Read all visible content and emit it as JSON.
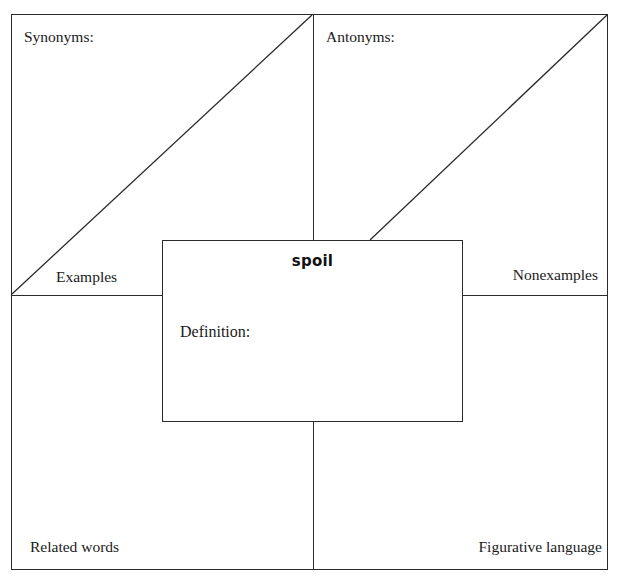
{
  "page": {
    "top_partial_text": "• •",
    "background_color": "#ffffff",
    "line_color": "#2b2b2b"
  },
  "organizer": {
    "type": "frayer-model-vocabulary-organizer",
    "center": {
      "word": "spoil",
      "definition_label": "Definition:"
    },
    "quadrants": [
      {
        "position": "top-left",
        "heading": "Synonyms:",
        "corner_label": "Examples",
        "has_diagonal": true
      },
      {
        "position": "top-right",
        "heading": "Antonyms:",
        "corner_label": "Nonexamples",
        "has_diagonal": true
      },
      {
        "position": "bottom-left",
        "heading": "",
        "corner_label": "Related words",
        "has_diagonal": false
      },
      {
        "position": "bottom-right",
        "heading": "",
        "corner_label": "Figurative language",
        "has_diagonal": false
      }
    ],
    "labels": {
      "synonyms": "Synonyms:",
      "antonyms": "Antonyms:",
      "examples": "Examples",
      "nonexamples": "Nonexamples",
      "related_words": "Related words",
      "figurative_language": "Figurative language",
      "word": "spoil",
      "definition": "Definition:"
    }
  }
}
